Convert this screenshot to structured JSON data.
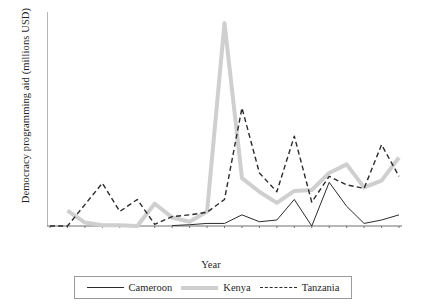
{
  "chart_data": {
    "type": "line",
    "title": "",
    "xlabel": "Year",
    "ylabel": "Democracy programming aid (millions USD)",
    "x": [
      1990,
      1991,
      1992,
      1993,
      1994,
      1995,
      1996,
      1997,
      1998,
      1999,
      2000,
      2001,
      2002,
      2003,
      2004,
      2005,
      2006,
      2007,
      2008,
      2009,
      2010
    ],
    "categories": [
      "1990",
      "1991",
      "1992",
      "1993",
      "1994",
      "1995",
      "1996",
      "1997",
      "1998",
      "1999",
      "2000",
      "2001",
      "2002",
      "2003",
      "2004",
      "2005",
      "2006",
      "2007",
      "2008",
      "2009",
      "2010"
    ],
    "xlim": [
      1990,
      2010
    ],
    "ylim": [
      0,
      250
    ],
    "yticks": [
      0,
      50,
      100,
      150,
      200,
      250
    ],
    "ytick_labels": [
      "0",
      "50",
      "100",
      "150",
      "200",
      "250"
    ],
    "grid": false,
    "legend_position": "bottom",
    "series": [
      {
        "name": "Cameroon",
        "style": "solid",
        "color": "#2b2b2b",
        "width": 1,
        "start_year": 1997,
        "values": [
          null,
          null,
          null,
          null,
          null,
          null,
          null,
          0.5,
          1.5,
          3,
          3,
          13,
          5,
          7,
          31,
          0,
          51,
          23,
          3,
          7,
          13
        ]
      },
      {
        "name": "Kenya",
        "style": "thick-solid",
        "color": "#cfcfcf",
        "width": 4,
        "start_year": 1991,
        "values": [
          null,
          18,
          4,
          1,
          1,
          0,
          26,
          10,
          5,
          17,
          237,
          56,
          40,
          27,
          41,
          42,
          62,
          72,
          45,
          53,
          80
        ]
      },
      {
        "name": "Tanzania",
        "style": "dashed",
        "color": "#2b2b2b",
        "width": 1.4,
        "start_year": 1990,
        "values": [
          0,
          0,
          25,
          50,
          17,
          31,
          2,
          11,
          13,
          16,
          31,
          138,
          62,
          40,
          105,
          28,
          58,
          48,
          44,
          95,
          58
        ]
      }
    ]
  },
  "legend": {
    "items": [
      {
        "label": "Cameroon",
        "swatch": "solid-line-swatch"
      },
      {
        "label": "Kenya",
        "swatch": "thick-band-swatch"
      },
      {
        "label": "Tanzania",
        "swatch": "dashed-line-swatch"
      }
    ]
  }
}
